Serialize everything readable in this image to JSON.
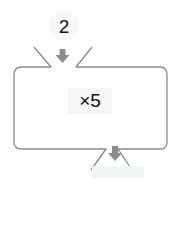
{
  "diagram": {
    "type": "function-machine",
    "input": {
      "value": "2"
    },
    "operation": {
      "label": "×5"
    },
    "output": {
      "value": ""
    },
    "colors": {
      "outline": "#8a8a8a",
      "arrow": "#8c8c8c",
      "text": "#111111",
      "output_box": "#f2f5f8"
    }
  }
}
